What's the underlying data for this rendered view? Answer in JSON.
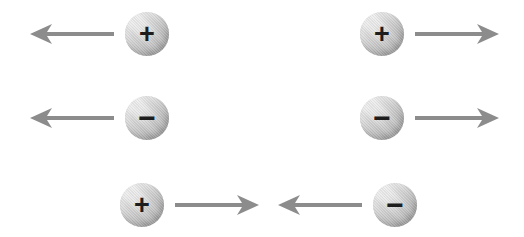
{
  "figure": {
    "background_color": "#ffffff",
    "width": 524,
    "height": 237
  },
  "style": {
    "arrow_color": "#8c8c8c",
    "sphere_highlight_color": "#ededed",
    "sphere_shadow_color": "#939393",
    "sign_color": "#1d1d1d"
  },
  "rows": [
    {
      "id": "row-1",
      "pairs": [
        {
          "id": "row1-left",
          "order": "arrow-then-charge",
          "arrow_direction": "left",
          "arrow_label": "←",
          "charge_sign": "+",
          "charge_polarity": "positive",
          "x": 30,
          "arrow_length": 84
        },
        {
          "id": "row1-right",
          "order": "charge-then-arrow",
          "arrow_direction": "right",
          "arrow_label": "→",
          "charge_sign": "+",
          "charge_polarity": "positive",
          "x": 360,
          "arrow_length": 84
        }
      ]
    },
    {
      "id": "row-2",
      "pairs": [
        {
          "id": "row2-left",
          "order": "arrow-then-charge",
          "arrow_direction": "left",
          "arrow_label": "←",
          "charge_sign": "−",
          "charge_polarity": "negative",
          "x": 30,
          "arrow_length": 84
        },
        {
          "id": "row2-right",
          "order": "charge-then-arrow",
          "arrow_direction": "right",
          "arrow_label": "→",
          "charge_sign": "−",
          "charge_polarity": "negative",
          "x": 360,
          "arrow_length": 84
        }
      ]
    },
    {
      "id": "row-3",
      "pairs": [
        {
          "id": "row3-left",
          "order": "charge-then-arrow",
          "arrow_direction": "right",
          "arrow_label": "→",
          "charge_sign": "+",
          "charge_polarity": "positive",
          "x": 120,
          "arrow_length": 84
        },
        {
          "id": "row3-right",
          "order": "arrow-then-charge",
          "arrow_direction": "left",
          "arrow_label": "←",
          "charge_sign": "−",
          "charge_polarity": "negative",
          "x": 278,
          "arrow_length": 84
        }
      ]
    }
  ]
}
